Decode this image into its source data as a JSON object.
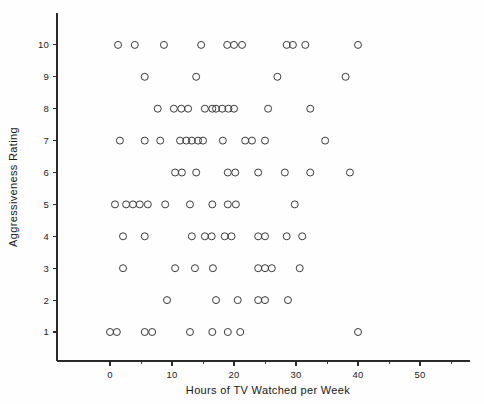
{
  "chart_data": {
    "type": "scatter",
    "title": "",
    "xlabel": "Hours of TV Watched per Week",
    "ylabel": "Aggressiveness Rating",
    "xlim": [
      -4,
      58
    ],
    "ylim": [
      0.2,
      11.2
    ],
    "xticks": [
      0,
      10,
      20,
      30,
      40,
      50
    ],
    "yticks": [
      1,
      2,
      3,
      4,
      5,
      6,
      7,
      8,
      9,
      10
    ],
    "xtick_labels": [
      "0",
      "10",
      "20",
      "30",
      "40",
      "50"
    ],
    "ytick_labels": [
      "1",
      "2",
      "3",
      "4",
      "5",
      "6",
      "7",
      "8",
      "9",
      "10"
    ],
    "x_minor_tick_step": 5,
    "grid": false,
    "legend": null,
    "marker": "open-circle",
    "marker_size_px": 7,
    "points": [
      {
        "x": 1.3,
        "y": 10
      },
      {
        "x": 4.0,
        "y": 10
      },
      {
        "x": 8.7,
        "y": 10
      },
      {
        "x": 14.7,
        "y": 10
      },
      {
        "x": 18.9,
        "y": 10
      },
      {
        "x": 20.0,
        "y": 10
      },
      {
        "x": 21.3,
        "y": 10
      },
      {
        "x": 28.5,
        "y": 10
      },
      {
        "x": 29.5,
        "y": 10
      },
      {
        "x": 31.5,
        "y": 10
      },
      {
        "x": 40.0,
        "y": 10
      },
      {
        "x": 5.6,
        "y": 9
      },
      {
        "x": 13.9,
        "y": 9
      },
      {
        "x": 27.0,
        "y": 9
      },
      {
        "x": 38.0,
        "y": 9
      },
      {
        "x": 7.7,
        "y": 8
      },
      {
        "x": 10.3,
        "y": 8
      },
      {
        "x": 11.5,
        "y": 8
      },
      {
        "x": 12.6,
        "y": 8
      },
      {
        "x": 15.3,
        "y": 8
      },
      {
        "x": 16.5,
        "y": 8
      },
      {
        "x": 17.1,
        "y": 8
      },
      {
        "x": 18.1,
        "y": 8
      },
      {
        "x": 19.1,
        "y": 8
      },
      {
        "x": 20.0,
        "y": 8
      },
      {
        "x": 25.5,
        "y": 8
      },
      {
        "x": 32.3,
        "y": 8
      },
      {
        "x": 1.6,
        "y": 7
      },
      {
        "x": 5.6,
        "y": 7
      },
      {
        "x": 8.1,
        "y": 7
      },
      {
        "x": 11.3,
        "y": 7
      },
      {
        "x": 12.3,
        "y": 7
      },
      {
        "x": 13.2,
        "y": 7
      },
      {
        "x": 14.2,
        "y": 7
      },
      {
        "x": 15.0,
        "y": 7
      },
      {
        "x": 18.2,
        "y": 7
      },
      {
        "x": 21.8,
        "y": 7
      },
      {
        "x": 22.9,
        "y": 7
      },
      {
        "x": 25.0,
        "y": 7
      },
      {
        "x": 34.7,
        "y": 7
      },
      {
        "x": 10.5,
        "y": 6
      },
      {
        "x": 11.6,
        "y": 6
      },
      {
        "x": 13.9,
        "y": 6
      },
      {
        "x": 19.0,
        "y": 6
      },
      {
        "x": 20.2,
        "y": 6
      },
      {
        "x": 23.9,
        "y": 6
      },
      {
        "x": 28.2,
        "y": 6
      },
      {
        "x": 32.3,
        "y": 6
      },
      {
        "x": 38.7,
        "y": 6
      },
      {
        "x": 0.8,
        "y": 5
      },
      {
        "x": 2.6,
        "y": 5
      },
      {
        "x": 3.7,
        "y": 5
      },
      {
        "x": 4.8,
        "y": 5
      },
      {
        "x": 6.1,
        "y": 5
      },
      {
        "x": 8.9,
        "y": 5
      },
      {
        "x": 12.9,
        "y": 5
      },
      {
        "x": 16.5,
        "y": 5
      },
      {
        "x": 19.0,
        "y": 5
      },
      {
        "x": 20.3,
        "y": 5
      },
      {
        "x": 29.8,
        "y": 5
      },
      {
        "x": 2.1,
        "y": 4
      },
      {
        "x": 5.6,
        "y": 4
      },
      {
        "x": 13.2,
        "y": 4
      },
      {
        "x": 15.3,
        "y": 4
      },
      {
        "x": 16.4,
        "y": 4
      },
      {
        "x": 18.5,
        "y": 4
      },
      {
        "x": 19.6,
        "y": 4
      },
      {
        "x": 23.9,
        "y": 4
      },
      {
        "x": 25.0,
        "y": 4
      },
      {
        "x": 28.5,
        "y": 4
      },
      {
        "x": 31.0,
        "y": 4
      },
      {
        "x": 2.1,
        "y": 3
      },
      {
        "x": 10.5,
        "y": 3
      },
      {
        "x": 13.7,
        "y": 3
      },
      {
        "x": 16.6,
        "y": 3
      },
      {
        "x": 23.9,
        "y": 3
      },
      {
        "x": 25.0,
        "y": 3
      },
      {
        "x": 26.1,
        "y": 3
      },
      {
        "x": 30.6,
        "y": 3
      },
      {
        "x": 9.2,
        "y": 2
      },
      {
        "x": 17.1,
        "y": 2
      },
      {
        "x": 20.6,
        "y": 2
      },
      {
        "x": 23.9,
        "y": 2
      },
      {
        "x": 25.0,
        "y": 2
      },
      {
        "x": 28.7,
        "y": 2
      },
      {
        "x": 0.0,
        "y": 1
      },
      {
        "x": 1.1,
        "y": 1
      },
      {
        "x": 5.6,
        "y": 1
      },
      {
        "x": 6.8,
        "y": 1
      },
      {
        "x": 12.9,
        "y": 1
      },
      {
        "x": 16.5,
        "y": 1
      },
      {
        "x": 19.0,
        "y": 1
      },
      {
        "x": 21.0,
        "y": 1
      },
      {
        "x": 40.0,
        "y": 1
      }
    ]
  }
}
